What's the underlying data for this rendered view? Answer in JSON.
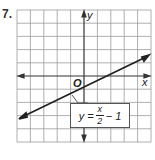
{
  "problem_number": "7.",
  "graph": {
    "x_axis_label": "x",
    "y_axis_label": "y",
    "origin_label": "O",
    "grid": {
      "columns": 10,
      "rows": 10,
      "x_range": [
        -5,
        5
      ],
      "y_range": [
        -5,
        5
      ]
    },
    "line": {
      "slope": 0.5,
      "intercept": -1
    },
    "equation": {
      "lhs": "y",
      "equals": "=",
      "numerator": "x",
      "denominator": "2",
      "rest": "− 1"
    }
  },
  "colors": {
    "grid": "#9a9a9a",
    "axis": "#333333",
    "line": "#222222"
  }
}
